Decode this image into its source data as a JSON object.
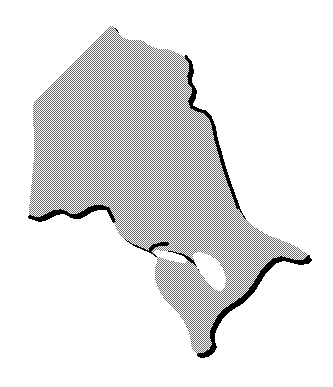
{
  "figure": {
    "title": "Ontario",
    "width": 333,
    "height": 387
  },
  "canvas": {
    "background_color": "#ffffff",
    "width": 333,
    "height": 387
  },
  "style": {
    "land_fill_pattern": "halftone-dither-50",
    "land_fill_color": "#9a9a9a",
    "land_dither_dark": "#4a4a4a",
    "land_dither_light": "#ffffff",
    "land_apparent_gray": "#b6b6b6",
    "shadow_color": "#000000",
    "water_color": "#ffffff",
    "outline_stroke_width": 1
  },
  "regions": [
    {
      "name": "ontario-landmass",
      "kind": "land",
      "fill": "halftone-dither-50",
      "path": "M 113,25 L 118,33 L 124,38 L 131,40 L 139,40 L 145,42 L 152,47 L 159,49 L 167,49 L 174,51 L 180,55 L 186,57 L 190,62 L 191,70 L 189,76 L 190,83 L 194,88 L 193,95 L 190,101 L 192,107 L 198,110 L 205,112 L 210,117 L 213,124 L 214,132 L 216,140 L 219,150 L 222,161 L 226,173 L 230,185 L 234,196 L 238,207 L 243,216 L 249,223 L 256,228 L 264,233 L 272,237 L 281,240 L 289,243 L 297,247 L 304,252 L 309,257 L 305,261 L 297,262 L 289,260 L 281,258 L 274,260 L 268,265 L 262,272 L 257,280 L 252,288 L 246,295 L 239,301 L 231,306 L 224,311 L 219,317 L 215,324 L 212,331 L 212,338 L 214,344 L 211,350 L 205,354 L 198,355 L 193,351 L 191,344 L 190,336 L 187,328 L 183,320 L 178,313 L 172,307 L 166,301 L 161,294 L 157,286 L 155,278 L 155,269 L 157,261 L 156,255 L 151,252 L 145,249 L 138,246 L 131,243 L 125,239 L 119,234 L 116,228 L 114,221 L 112,214 L 108,209 L 102,207 L 95,207 L 89,209 L 83,213 L 77,216 L 71,216 L 66,213 L 60,211 L 54,212 L 48,215 L 42,218 L 36,219 L 30,217 L 29,210 L 30,200 L 31,190 L 32,180 L 33,168 L 34,156 L 34,144 L 34,132 L 33,120 L 33,110 L 34,101 L 40,95 L 47,88 L 55,80 L 63,72 L 72,63 L 81,54 L 90,45 L 99,36 L 107,28 Z"
    },
    {
      "name": "georgian-bay-water",
      "kind": "water",
      "fill": "#ffffff",
      "path": "M 199,252 L 207,254 L 214,258 L 220,264 L 224,271 L 226,279 L 225,287 L 221,292 L 215,290 L 210,285 L 205,279 L 200,272 L 196,265 L 193,258 L 194,253 Z"
    },
    {
      "name": "lake-superior-inlet",
      "kind": "water",
      "fill": "#ffffff",
      "path": "M 155,250 L 165,251 L 175,253 L 183,256 L 188,260 L 184,263 L 176,262 L 167,260 L 159,257 L 154,254 Z"
    }
  ],
  "shadow_edges": [
    {
      "name": "north-east-border-shadow",
      "path": "M 186,57 L 190,62 L 191,70 L 189,76 L 190,83 L 194,88 L 193,95 L 190,101 L 192,107 L 198,110 L 205,112 L 210,117 L 213,124"
    },
    {
      "name": "quebec-border-shadow",
      "path": "M 213,124 L 216,140 L 219,150 L 222,161 L 226,173 L 230,185 L 234,196 L 238,207"
    },
    {
      "name": "saint-lawrence-shadow",
      "path": "M 309,257 L 305,261 L 297,262 L 289,260 L 281,258 L 274,260 L 268,265 L 262,272 L 257,280 L 252,288 L 246,295 L 239,301"
    },
    {
      "name": "lake-erie-shadow",
      "path": "M 239,301 L 231,306 L 224,311 L 219,317 L 215,324 L 212,331 L 212,338 L 214,344 L 211,350 L 205,354 L 198,355"
    },
    {
      "name": "bruce-peninsula-shadow",
      "path": "M 156,255 L 163,253 L 172,253 L 181,255 L 189,259 L 196,264 L 201,270"
    },
    {
      "name": "lake-superior-shadow",
      "path": "M 168,244 L 161,244 L 154,246 L 150,250"
    },
    {
      "name": "minnesota-border-shadow",
      "path": "M 114,221 L 108,209 L 102,207 L 95,207 L 89,209 L 83,213 L 77,216 L 71,216 L 66,213 L 60,211 L 54,212 L 48,215 L 42,218 L 36,219 L 30,217"
    }
  ],
  "labels": {
    "none_visible": ""
  }
}
